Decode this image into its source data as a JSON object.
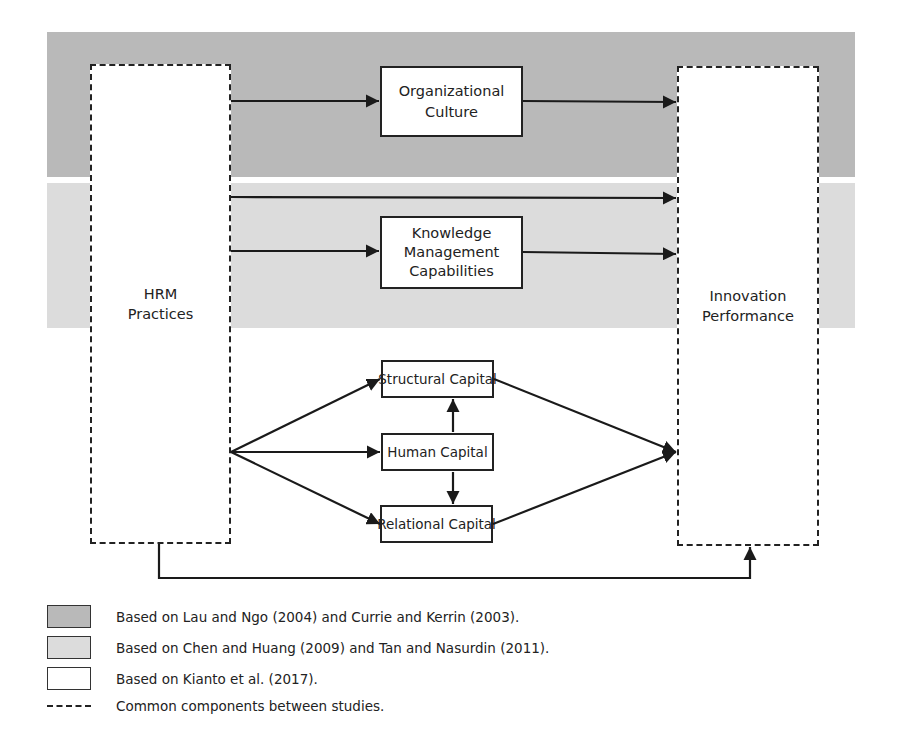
{
  "diagram": {
    "type": "conceptual-framework",
    "bands": [
      {
        "name": "band-lau-ngo-currie-kerrin",
        "color": "#b9b9b9"
      },
      {
        "name": "band-chen-huang-tan-nasurdin",
        "color": "#dcdcdc"
      }
    ],
    "nodes": {
      "hrm": "HRM\nPractices",
      "innovation": "Innovation\nPerformance",
      "org_culture": "Organizational\nCulture",
      "km": "Knowledge\nManagement\nCapabilities",
      "structural": "Structural Capital",
      "human": "Human Capital",
      "relational": "Relational Capital"
    },
    "edges": [
      {
        "from": "HRM Practices",
        "to": "Organizational Culture"
      },
      {
        "from": "Organizational Culture",
        "to": "Innovation Performance"
      },
      {
        "from": "HRM Practices",
        "to": "Innovation Performance",
        "band": "light"
      },
      {
        "from": "HRM Practices",
        "to": "Knowledge Management Capabilities"
      },
      {
        "from": "Knowledge Management Capabilities",
        "to": "Innovation Performance"
      },
      {
        "from": "HRM Practices",
        "to": "Structural Capital"
      },
      {
        "from": "HRM Practices",
        "to": "Human Capital"
      },
      {
        "from": "HRM Practices",
        "to": "Relational Capital"
      },
      {
        "from": "Human Capital",
        "to": "Structural Capital"
      },
      {
        "from": "Human Capital",
        "to": "Relational Capital"
      },
      {
        "from": "Structural Capital",
        "to": "Innovation Performance"
      },
      {
        "from": "Relational Capital",
        "to": "Innovation Performance"
      },
      {
        "from": "HRM Practices",
        "to": "Innovation Performance",
        "route": "bottom-loop"
      }
    ]
  },
  "legend": {
    "items": [
      {
        "swatch": "#b9b9b9",
        "text": "Based on Lau and Ngo (2004) and Currie and Kerrin (2003)."
      },
      {
        "swatch": "#dcdcdc",
        "text": "Based on Chen and Huang (2009) and Tan and Nasurdin (2011)."
      },
      {
        "swatch": "#ffffff",
        "text": "Based on Kianto et al. (2017)."
      },
      {
        "swatch": "dashed",
        "text": "Common components between studies."
      }
    ]
  }
}
